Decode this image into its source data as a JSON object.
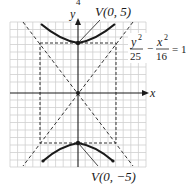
{
  "figure": {
    "type": "hyperbola-graph",
    "top_fragment": "4",
    "axes": {
      "x_label": "x",
      "y_label": "y"
    },
    "equation": {
      "term1_num": "y",
      "term1_exp": "2",
      "term1_den": "25",
      "minus": "−",
      "term2_num": "x",
      "term2_exp": "2",
      "term2_den": "16",
      "equals": "= 1"
    },
    "vertices": [
      {
        "label": "V(0, 5)",
        "x": 0,
        "y": 5
      },
      {
        "label": "V(0, −5)",
        "x": 0,
        "y": -5
      }
    ],
    "a": 5,
    "b": 4,
    "asymptotes": [
      "y = 5/4 x",
      "y = −5/4 x"
    ],
    "fundamental_rectangle": {
      "x": [
        -4,
        4
      ],
      "y": [
        -5,
        5
      ]
    },
    "colors": {
      "curve": "#1a1a1a",
      "grid": "#c8c8c8",
      "axis": "#1a1a1a",
      "dashed": "#333333"
    }
  }
}
